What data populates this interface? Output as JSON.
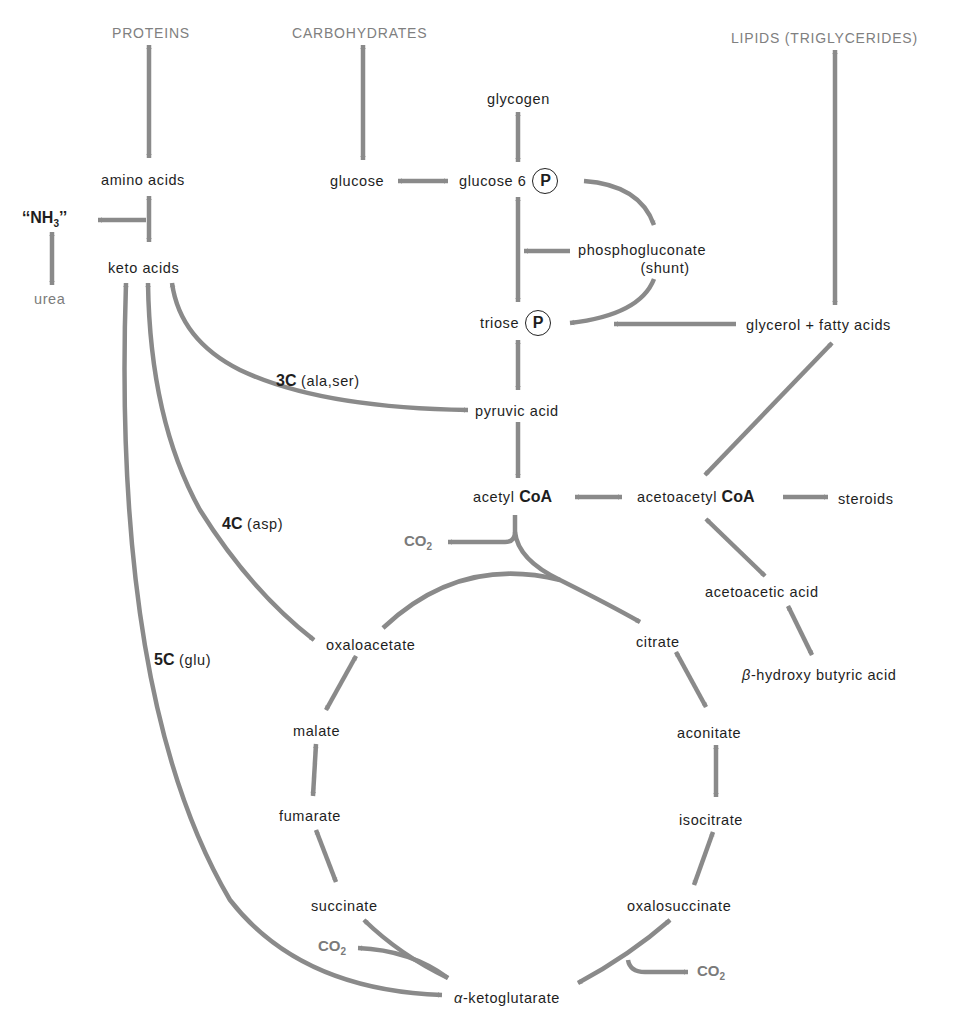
{
  "headings": {
    "proteins": "PROTEINS",
    "carbohydrates": "CARBOHYDRATES",
    "lipids": "LIPIDS (TRIGLYCERIDES)"
  },
  "nodes": {
    "amino_acids": "amino acids",
    "nh3_prefix": "‘‘NH",
    "nh3_sub": "3",
    "nh3_suffix": "’’",
    "urea": "urea",
    "keto_acids": "keto acids",
    "glycogen": "glycogen",
    "glucose": "glucose",
    "glucose6p": "glucose 6",
    "phospho_symbol": "P",
    "phosphogluconate": "phosphogluconate",
    "shunt": "(shunt)",
    "triose": "triose",
    "glycerol_fatty_acids": "glycerol + fatty acids",
    "pyruvic_acid": "pyruvic acid",
    "acetyl": "acetyl",
    "coa": "CoA",
    "acetoacetyl": "acetoacetyl",
    "steroids": "steroids",
    "acetoacetic_acid": "acetoacetic acid",
    "beta_prefix": "β",
    "beta_hydroxy_butyric": "-hydroxy butyric acid",
    "oxaloacetate": "oxaloacetate",
    "citrate": "citrate",
    "malate": "malate",
    "aconitate": "aconitate",
    "fumarate": "fumarate",
    "isocitrate": "isocitrate",
    "succinate": "succinate",
    "oxalosuccinate": "oxalosuccinate",
    "alpha_prefix": "α",
    "ketoglutarate": "-ketoglutarate",
    "co2_main": "CO",
    "co2_sub": "2"
  },
  "pathway_labels": {
    "c3_bold": "3C",
    "c3_detail": "(ala,ser)",
    "c4_bold": "4C",
    "c4_detail": "(asp)",
    "c5_bold": "5C",
    "c5_detail": "(glu)"
  },
  "colors": {
    "arrow": "#8a8a8a",
    "text": "#1e1e1e",
    "heading": "#808080"
  }
}
